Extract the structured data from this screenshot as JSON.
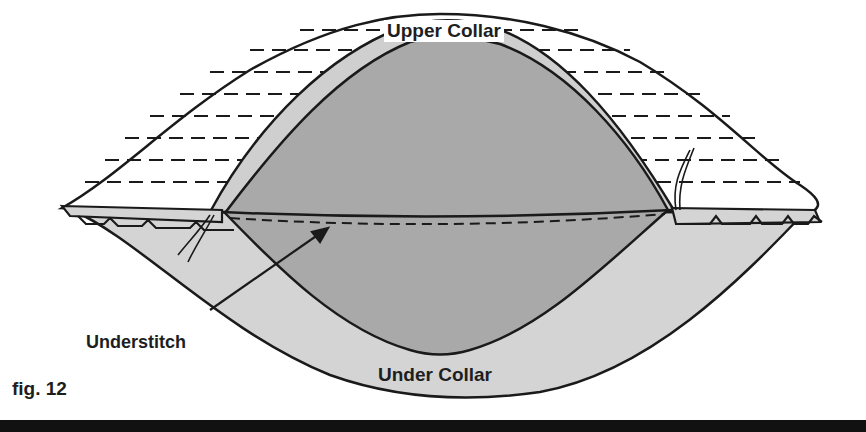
{
  "figure": {
    "caption": "fig. 12",
    "labels": {
      "upper_collar": "Upper Collar",
      "under_collar": "Under Collar",
      "understitch": "Understitch"
    },
    "colors": {
      "upper_collar_fill": "#ffffff",
      "under_collar_fill": "#d4d4d4",
      "inner_fill": "#a9a9a9",
      "band_fill": "#cfcfcf",
      "line": "#1a1a1a",
      "rule": "#111111"
    }
  }
}
